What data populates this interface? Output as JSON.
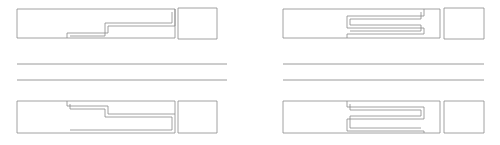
{
  "figure": {
    "background_color": "#ffffff",
    "stroke_color": "#8a8a8a",
    "divider_color": "#8f8f8f",
    "canvas": {
      "width": 500,
      "height": 145
    },
    "layout": {
      "rows": 2,
      "columns": 2,
      "column_labels": [
        "left",
        "right"
      ],
      "row_labels": [
        "top",
        "bottom"
      ]
    },
    "panels": [
      {
        "id": "top-left",
        "name": "stepped-beam-top-left",
        "kind": "stepped-interlocking-outline",
        "orientation": "step-down",
        "bounds": {
          "x": 17,
          "y": 8,
          "width": 200,
          "height": 35
        },
        "outer_path": "M17,9 L175,9 L175,38 L17,38 Z",
        "inner_paths": [
          "M175,9 L175,26 L108,26 L108,33 L67,33 L67,38",
          "M172,12 L172,23 L105,23 L105,36 L70,36"
        ],
        "side_block": {
          "x": 178,
          "y": 8,
          "width": 39,
          "height": 31
        }
      },
      {
        "id": "top-right",
        "name": "serpentine-beam-top-right",
        "kind": "serpentine-meander-outline",
        "orientation": "meander-down",
        "bounds": {
          "x": 283,
          "y": 8,
          "width": 201,
          "height": 35
        },
        "outer_path": "M283,9 L440,9 L440,38 L283,38 Z",
        "inner_paths": [
          "M424,9 L424,16 L347,16 L347,28 L424,28 L424,34 L347,34",
          "M421,12 L421,19 L350,19 L350,25 L421,25 L421,31 L350,31"
        ],
        "side_block": {
          "x": 444,
          "y": 8,
          "width": 40,
          "height": 31
        }
      },
      {
        "id": "bottom-left",
        "name": "stepped-beam-bottom-left",
        "kind": "stepped-interlocking-outline",
        "orientation": "step-up",
        "bounds": {
          "x": 17,
          "y": 100,
          "width": 200,
          "height": 35
        },
        "outer_path": "M17,101 L175,101 L175,133 L17,133 Z",
        "inner_paths": [
          "M67,101 L67,106 L108,106 L108,114 L175,114 L175,133",
          "M70,104 L70,109 L105,109 L105,117 L172,117 L172,130"
        ],
        "side_block": {
          "x": 178,
          "y": 101,
          "width": 39,
          "height": 32
        }
      },
      {
        "id": "bottom-right",
        "name": "serpentine-beam-bottom-right",
        "kind": "serpentine-meander-outline",
        "orientation": "meander-up",
        "bounds": {
          "x": 283,
          "y": 100,
          "width": 201,
          "height": 35
        },
        "outer_path": "M283,101 L440,101 L440,133 L283,133 Z",
        "inner_paths": [
          "M347,101 L347,107 L424,107 L424,119 L347,119 L347,131 L424,131",
          "M350,104 L350,110 L421,110 L421,116 L350,116 L350,128 L421,128"
        ],
        "side_block": {
          "x": 444,
          "y": 101,
          "width": 40,
          "height": 32
        }
      }
    ],
    "dividers": [
      {
        "id": "divider-left-upper",
        "name": "divider-line-left-upper",
        "x1": 17,
        "y1": 64,
        "x2": 227,
        "y2": 64
      },
      {
        "id": "divider-left-lower",
        "name": "divider-line-left-lower",
        "x1": 17,
        "y1": 80,
        "x2": 227,
        "y2": 80
      },
      {
        "id": "divider-right-upper",
        "name": "divider-line-right-upper",
        "x1": 283,
        "y1": 64,
        "x2": 484,
        "y2": 64
      },
      {
        "id": "divider-right-lower",
        "name": "divider-line-right-lower",
        "x1": 283,
        "y1": 80,
        "x2": 484,
        "y2": 80
      }
    ]
  }
}
